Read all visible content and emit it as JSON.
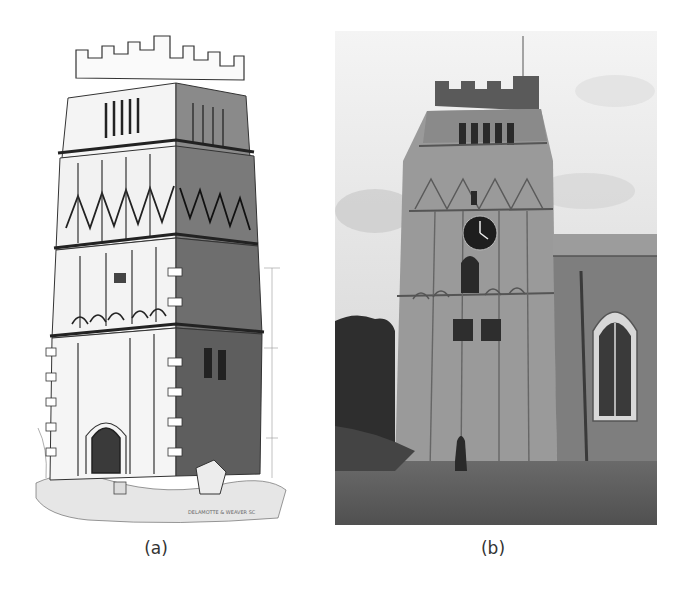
{
  "figure": {
    "panels": [
      {
        "id": "a",
        "label": "(a)",
        "content": "engraving-of-church-tower",
        "engraver_signature": "engraver signature (illegible)"
      },
      {
        "id": "b",
        "label": "(b)",
        "content": "photograph-of-church-tower-with-clock"
      }
    ]
  }
}
